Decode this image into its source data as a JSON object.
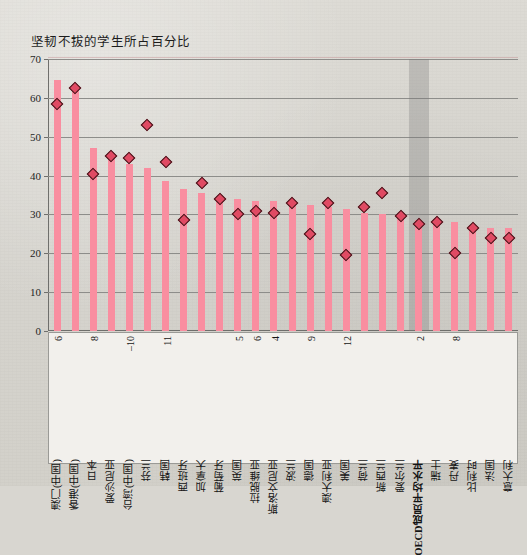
{
  "chart_data": {
    "type": "bar",
    "title": "坚韧不拔的学生所占百分比",
    "xlabel": "",
    "ylabel": "",
    "ylim": [
      0,
      70
    ],
    "ytick_step": 10,
    "yticks": [
      0,
      10,
      20,
      30,
      40,
      50,
      60,
      70
    ],
    "grid": true,
    "legend": "none",
    "colors": {
      "bar": "#f98ea0",
      "marker_fill": "#e04a63",
      "marker_edge": "#3a1014",
      "highlight_band": "#787876",
      "background": "#d8d6d0",
      "gridline": "#8d8d8a",
      "axis": "#6f6f6c",
      "label_panel": "#f2f0ec"
    },
    "highlight_category": "OECD成员平均水平",
    "categories": [
      "澳门(中国)",
      "香港(中国)",
      "日本",
      "爱沙尼亚",
      "台湾(中国)",
      "芬兰",
      "韩国",
      "西班牙",
      "加拿大",
      "葡萄牙",
      "英国",
      "拉脱维亚",
      "斯洛文尼亚",
      "波兰",
      "德国",
      "澳大利亚",
      "美国",
      "荷兰",
      "新西兰",
      "爱尔兰",
      "OECD成员平均水平",
      "瑞士",
      "丹麦",
      "比利时",
      "法国",
      "意大利"
    ],
    "series": [
      {
        "name": "bar",
        "values": [
          64.5,
          62.5,
          47.0,
          45.0,
          43.0,
          42.0,
          38.5,
          36.5,
          35.5,
          34.5,
          34.0,
          33.5,
          33.5,
          33.0,
          32.5,
          32.0,
          31.5,
          30.5,
          30.0,
          29.5,
          28.5,
          28.0,
          28.0,
          27.0,
          26.5,
          26.5
        ]
      },
      {
        "name": "marker",
        "values": [
          58.5,
          62.5,
          40.5,
          45.0,
          44.5,
          53.0,
          43.5,
          28.5,
          38.0,
          34.0,
          30.0,
          31.0,
          30.5,
          33.0,
          25.0,
          33.0,
          19.5,
          32.0,
          35.5,
          29.5,
          27.5,
          28.0,
          20.0,
          26.5,
          24.0,
          24.0
        ]
      }
    ],
    "annotations": [
      {
        "category": "澳门(中国)",
        "text": "6"
      },
      {
        "category": "日本",
        "text": "8"
      },
      {
        "category": "台湾(中国)",
        "text": "–10"
      },
      {
        "category": "韩国",
        "text": "11"
      },
      {
        "category": "英国",
        "text": "5"
      },
      {
        "category": "拉脱维亚",
        "text": "6"
      },
      {
        "category": "斯洛文尼亚",
        "text": "4"
      },
      {
        "category": "德国",
        "text": "9"
      },
      {
        "category": "美国",
        "text": "12"
      },
      {
        "category": "OECD成员平均水平",
        "text": "2"
      },
      {
        "category": "丹麦",
        "text": "8"
      }
    ]
  }
}
